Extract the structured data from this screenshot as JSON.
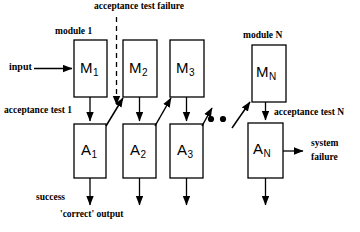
{
  "diagram": {
    "colors": {
      "stroke": "#000000",
      "fill": "#ffffff",
      "background": "#ffffff"
    },
    "modules": [
      {
        "id": "M1",
        "label": "M",
        "sub": "1",
        "x": 74,
        "y": 40,
        "w": 33,
        "h": 57
      },
      {
        "id": "M2",
        "label": "M",
        "sub": "2",
        "x": 123,
        "y": 40,
        "w": 34,
        "h": 57
      },
      {
        "id": "M3",
        "label": "M",
        "sub": "3",
        "x": 170,
        "y": 40,
        "w": 34,
        "h": 57
      },
      {
        "id": "MN",
        "label": "M",
        "sub": "N",
        "x": 252,
        "y": 45,
        "w": 34,
        "h": 57
      }
    ],
    "acceptance_tests": [
      {
        "id": "A1",
        "label": "A",
        "sub": "1",
        "x": 74,
        "y": 124,
        "w": 32,
        "h": 54
      },
      {
        "id": "A2",
        "label": "A",
        "sub": "2",
        "x": 123,
        "y": 124,
        "w": 33,
        "h": 54
      },
      {
        "id": "A3",
        "label": "A",
        "sub": "3",
        "x": 170,
        "y": 124,
        "w": 33,
        "h": 54
      },
      {
        "id": "AN",
        "label": "A",
        "sub": "N",
        "x": 248,
        "y": 123,
        "w": 35,
        "h": 55
      }
    ],
    "labels": {
      "module_1": "module 1",
      "module_n": "module N",
      "acceptance_test_failure": "acceptance test failure",
      "acceptance_test_1": "acceptance test 1",
      "acceptance_test_n": "acceptance test N",
      "input": "input",
      "success": "success",
      "correct_output": "'correct' output",
      "system_failure_line1": "system",
      "system_failure_line2": "failure",
      "ellipsis": "• •"
    }
  }
}
